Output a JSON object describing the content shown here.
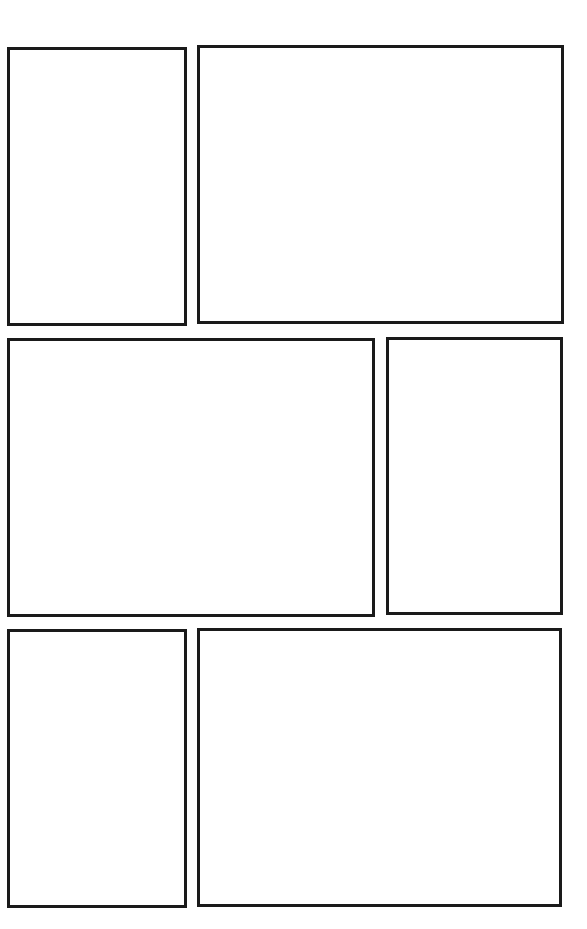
{
  "page": {
    "type": "comic-page-template",
    "background_color": "#ffffff",
    "border_color": "#1a1a1a",
    "rows": 3,
    "panel_count": 6
  },
  "panels": [
    {
      "id": "panel-1",
      "row": 1,
      "x": 7,
      "y": 47,
      "w": 180,
      "h": 279
    },
    {
      "id": "panel-2",
      "row": 1,
      "x": 197,
      "y": 45,
      "w": 367,
      "h": 279
    },
    {
      "id": "panel-3",
      "row": 2,
      "x": 7,
      "y": 338,
      "w": 368,
      "h": 279
    },
    {
      "id": "panel-4",
      "row": 2,
      "x": 386,
      "y": 337,
      "w": 177,
      "h": 278
    },
    {
      "id": "panel-5",
      "row": 3,
      "x": 7,
      "y": 629,
      "w": 180,
      "h": 279
    },
    {
      "id": "panel-6",
      "row": 3,
      "x": 197,
      "y": 628,
      "w": 365,
      "h": 279
    }
  ]
}
